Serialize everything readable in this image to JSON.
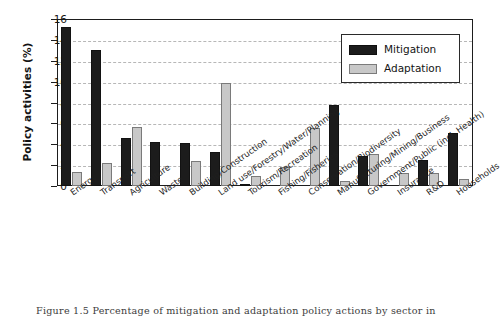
{
  "figure": {
    "caption": "Figure 1.5  Percentage of mitigation and adaptation policy actions by sector in"
  },
  "legend": {
    "position": "top-right",
    "items": [
      {
        "label": "Mitigation",
        "color": "#1c1c1c",
        "swatch": "mitigation-swatch"
      },
      {
        "label": "Adaptation",
        "color": "#c8c8c8",
        "swatch": "adaptation-swatch"
      }
    ]
  },
  "axes": {
    "y_title": "Policy activities (%)",
    "y_ticks": [
      "0",
      "2",
      "4",
      "6",
      "8",
      "10",
      "12",
      "14",
      "16"
    ],
    "x_title": ""
  },
  "chart_data": {
    "type": "bar",
    "title": "",
    "subtitle": "",
    "xlabel": "",
    "ylabel": "Policy activities (%)",
    "ylim": [
      0,
      16
    ],
    "ytick_step": 2,
    "grid": true,
    "grid_style": "dashed-horizontal",
    "legend_position": "upper right",
    "categories": [
      "Energy",
      "Transport",
      "Agriculture",
      "Waste",
      "Building/Construction",
      "Land use/Forestry/Water/Planning",
      "Tourism/Recreation",
      "Fishing/Fisheries",
      "Conservation/Biodiversity",
      "Manufacturing/Mining/Business",
      "Government/Public (incl. Health)",
      "Insurance",
      "R&D",
      "Households"
    ],
    "series": [
      {
        "name": "Mitigation",
        "color": "#1c1c1c",
        "values": [
          15.2,
          13.0,
          4.6,
          4.2,
          4.1,
          3.25,
          0.1,
          0.0,
          0.05,
          7.8,
          2.85,
          0.0,
          2.5,
          5.1
        ]
      },
      {
        "name": "Adaptation",
        "color": "#c8c8c8",
        "values": [
          1.3,
          2.2,
          5.7,
          0.05,
          2.4,
          9.85,
          0.95,
          1.85,
          5.55,
          0.45,
          3.1,
          1.25,
          1.2,
          0.65
        ]
      }
    ]
  }
}
